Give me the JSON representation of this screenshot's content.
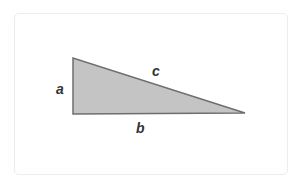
{
  "diagram": {
    "type": "right-triangle",
    "vertices": {
      "top_left": [
        73,
        58
      ],
      "bottom_left": [
        73,
        114
      ],
      "bottom_right": [
        245,
        113
      ]
    },
    "fill_color": "#c4c4c4",
    "stroke_color": "#6e6e6e",
    "labels": {
      "a": "a",
      "b": "b",
      "c": "c"
    }
  }
}
